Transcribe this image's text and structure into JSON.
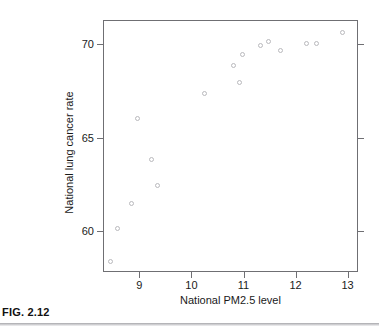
{
  "figure": {
    "caption": "FIG. 2.12"
  },
  "chart_data": {
    "type": "scatter",
    "title": "",
    "xlabel": "National PM2.5 level",
    "ylabel": "National lung cancer rate",
    "xlim": [
      8.3,
      13.2
    ],
    "ylim": [
      57.8,
      71.3
    ],
    "xticks": [
      9,
      10,
      11,
      12,
      13
    ],
    "xticklabels": [
      "9",
      "10",
      "11",
      "12",
      "13"
    ],
    "yticks": [
      60,
      65,
      70
    ],
    "yticklabels": [
      "60",
      "65",
      "70"
    ],
    "grid": false,
    "legend": null,
    "marker": "open-circle",
    "marker_color": "#b9b9bd",
    "points": [
      {
        "x": 8.42,
        "y": 58.4
      },
      {
        "x": 8.55,
        "y": 60.2
      },
      {
        "x": 8.82,
        "y": 61.5
      },
      {
        "x": 8.95,
        "y": 66.1
      },
      {
        "x": 9.22,
        "y": 63.9
      },
      {
        "x": 9.32,
        "y": 62.5
      },
      {
        "x": 10.24,
        "y": 67.4
      },
      {
        "x": 10.78,
        "y": 68.9
      },
      {
        "x": 10.91,
        "y": 68.0
      },
      {
        "x": 10.96,
        "y": 69.5
      },
      {
        "x": 11.31,
        "y": 70.0
      },
      {
        "x": 11.46,
        "y": 70.2
      },
      {
        "x": 11.69,
        "y": 69.7
      },
      {
        "x": 12.19,
        "y": 70.1
      },
      {
        "x": 12.39,
        "y": 70.1
      },
      {
        "x": 12.88,
        "y": 70.7
      }
    ]
  }
}
